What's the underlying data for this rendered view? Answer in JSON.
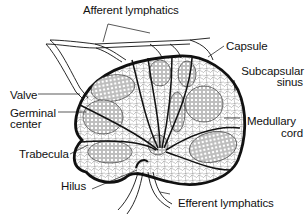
{
  "diagram": {
    "labels": {
      "afferent_lymphatics": "Afferent lymphatics",
      "capsule": "Capsule",
      "subcapsular_sinus_line1": "Subcapsular",
      "subcapsular_sinus_line2": "sinus",
      "valve": "Valve",
      "germinal_center_line1": "Germinal",
      "germinal_center_line2": "center",
      "medullary_cord_line1": "Medullary",
      "medullary_cord_line2": "cord",
      "trabecula": "Trabecula",
      "hilus": "Hilus",
      "efferent_lymphatics": "Efferent  lymphatics"
    },
    "colors": {
      "line": "#111111",
      "background": "#ffffff",
      "tissue": "#e8e8e8"
    }
  }
}
